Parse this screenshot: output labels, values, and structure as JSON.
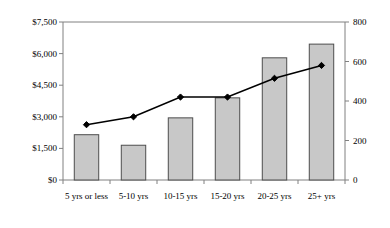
{
  "chart_data": {
    "type": "bar",
    "title": "",
    "subtitle": "",
    "xlabel": "",
    "ylabel": "",
    "grid": false,
    "legend": "none",
    "categories": [
      "5 yrs or less",
      "5-10 yrs",
      "10-15 yrs",
      "15-20 yrs",
      "20-25 yrs",
      "25+ yrs"
    ],
    "series": [
      {
        "name": "Bars",
        "type": "bar",
        "axis": "left",
        "values": [
          2150,
          1650,
          2950,
          3900,
          5800,
          6450
        ]
      },
      {
        "name": "Line",
        "type": "line",
        "axis": "right",
        "values": [
          280,
          320,
          420,
          420,
          515,
          580
        ]
      }
    ],
    "left_axis": {
      "label": "",
      "ylim": [
        0,
        7500
      ],
      "ticks": [
        0,
        1500,
        3000,
        4500,
        6000,
        7500
      ],
      "tick_labels": [
        "$0",
        "$1,500",
        "$3,000",
        "$4,500",
        "$6,000",
        "$7,500"
      ]
    },
    "right_axis": {
      "label": "",
      "ylim": [
        0,
        800
      ],
      "ticks": [
        0,
        200,
        400,
        600,
        800
      ],
      "tick_labels": [
        "0",
        "200",
        "400",
        "600",
        "800"
      ]
    },
    "colors": {
      "bar_fill": "#c8c8c8",
      "bar_stroke": "#4d4d4d",
      "line_stroke": "#000000",
      "marker_fill": "#000000",
      "axis": "#808080",
      "background": "#ffffff"
    }
  }
}
